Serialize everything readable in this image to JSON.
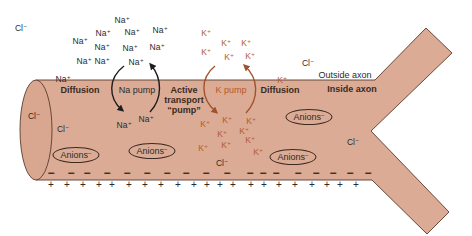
{
  "figure": {
    "colors": {
      "axon_fill": "#dbab95",
      "axon_stroke": "#5a3a2c",
      "sodium_text": "#2b2b2b",
      "potassium_text": "#b35a2a",
      "na_arrow": "#1e1e1e",
      "k_arrow": "#a0522d"
    }
  },
  "labels": {
    "outside_axon": "Outside axon",
    "inside_axon": "Inside axon",
    "diffusion_left": "Diffusion",
    "diffusion_right": "Diffusion",
    "na_pump": "Na pump",
    "k_pump": "K pump",
    "active_transport_line1": "Active",
    "active_transport_line2": "transport",
    "active_transport_line3": "“pump”"
  },
  "ions": {
    "na_base": "Na",
    "k_base": "K",
    "cl_base": "Cl",
    "plus": "+",
    "minus": "−"
  },
  "sodium_outside": [
    {
      "x": 122,
      "y": 20
    },
    {
      "x": 103,
      "y": 33
    },
    {
      "x": 132,
      "y": 32
    },
    {
      "x": 160,
      "y": 30
    },
    {
      "x": 80,
      "y": 41
    },
    {
      "x": 102,
      "y": 47
    },
    {
      "x": 130,
      "y": 48
    },
    {
      "x": 157,
      "y": 47
    },
    {
      "x": 84,
      "y": 61
    },
    {
      "x": 102,
      "y": 61
    },
    {
      "x": 136,
      "y": 62
    },
    {
      "x": 63,
      "y": 79
    }
  ],
  "sodium_inside": [
    {
      "x": 124,
      "y": 125
    },
    {
      "x": 146,
      "y": 119
    }
  ],
  "potassium_outside": [
    {
      "x": 206,
      "y": 33
    },
    {
      "x": 226,
      "y": 43
    },
    {
      "x": 246,
      "y": 43
    },
    {
      "x": 206,
      "y": 52
    },
    {
      "x": 229,
      "y": 57
    },
    {
      "x": 250,
      "y": 56
    },
    {
      "x": 282,
      "y": 80
    }
  ],
  "potassium_inside": [
    {
      "x": 205,
      "y": 124
    },
    {
      "x": 227,
      "y": 120
    },
    {
      "x": 251,
      "y": 121
    },
    {
      "x": 222,
      "y": 134
    },
    {
      "x": 244,
      "y": 131
    },
    {
      "x": 203,
      "y": 148
    },
    {
      "x": 226,
      "y": 145
    },
    {
      "x": 250,
      "y": 140
    },
    {
      "x": 258,
      "y": 152
    }
  ],
  "chloride": [
    {
      "x": 21,
      "y": 28,
      "region": "outside"
    },
    {
      "x": 308,
      "y": 63,
      "region": "outside"
    },
    {
      "x": 34,
      "y": 116,
      "region": "inside"
    },
    {
      "x": 63,
      "y": 129,
      "region": "inside"
    },
    {
      "x": 222,
      "y": 163,
      "region": "inside"
    },
    {
      "x": 353,
      "y": 142,
      "region": "inside"
    }
  ],
  "anions": [
    {
      "label": "Anions",
      "charge": "−",
      "x": 76,
      "y": 155
    },
    {
      "label": "Anions",
      "charge": "−",
      "x": 152,
      "y": 151
    },
    {
      "label": "Anions",
      "charge": "−",
      "x": 309,
      "y": 117
    },
    {
      "label": "Anions",
      "charge": "−",
      "x": 293,
      "y": 157
    }
  ],
  "membrane_charges": {
    "inside_minus_x": [
      51,
      71,
      87,
      107,
      127,
      147,
      167,
      186,
      206,
      227,
      250,
      263,
      276,
      298,
      316,
      333,
      350,
      368
    ],
    "inside_minus_y": 173,
    "outside_plus_x": [
      51,
      67,
      83,
      99,
      112,
      129,
      145,
      161,
      178,
      194,
      207,
      220,
      233,
      251,
      264,
      279,
      295,
      312,
      327,
      340,
      356
    ],
    "outside_plus_y": 185
  }
}
